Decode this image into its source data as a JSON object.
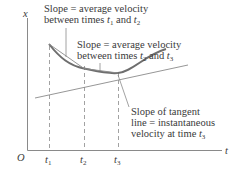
{
  "diagram": {
    "axes": {
      "y_label": "x",
      "x_label": "t",
      "origin_label": "O"
    },
    "ticks": [
      {
        "name": "t",
        "sub": "1"
      },
      {
        "name": "t",
        "sub": "2"
      },
      {
        "name": "t",
        "sub": "3"
      }
    ],
    "annotations": {
      "secant_12": {
        "line1": "Slope  = average velocity",
        "line2_prefix": "between times ",
        "t_a": "t",
        "t_a_sub": "1",
        "and": " and ",
        "t_b": "t",
        "t_b_sub": "2"
      },
      "secant_23": {
        "line1": "Slope  = average velocity",
        "line2_prefix": "between times ",
        "t_a": "t",
        "t_a_sub": "2",
        "and": " and ",
        "t_b": "t",
        "t_b_sub": "3"
      },
      "tangent": {
        "line1": "Slope of tangent",
        "line2": "line = instantaneous",
        "line3_prefix": "velocity at time ",
        "t": "t",
        "t_sub": "3"
      }
    },
    "colors": {
      "curve": "#707070",
      "lines": "#8a8a8a",
      "text": "#3a3a3a"
    }
  }
}
